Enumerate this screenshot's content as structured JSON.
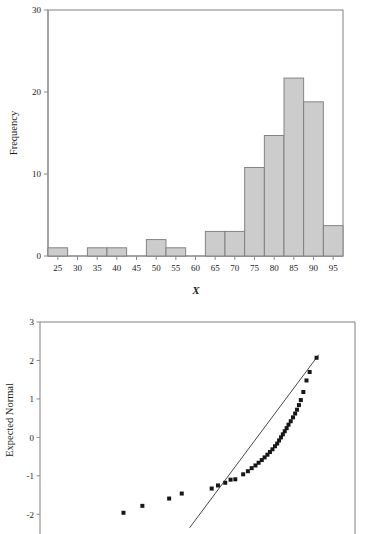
{
  "chart_data": [
    {
      "id": "histogram",
      "type": "bar",
      "title": "",
      "xlabel": "X",
      "ylabel": "Frequency",
      "xlim": [
        22.5,
        97.5
      ],
      "ylim": [
        0,
        30
      ],
      "grid": false,
      "legend": "none",
      "bin_width": 5,
      "xticks": [
        25,
        30,
        35,
        40,
        45,
        50,
        55,
        60,
        65,
        70,
        75,
        80,
        85,
        90,
        95
      ],
      "yticks": [
        0,
        10,
        20,
        30
      ],
      "bin_centers": [
        25,
        30,
        35,
        40,
        45,
        50,
        55,
        60,
        65,
        70,
        75,
        80,
        85,
        90,
        95
      ],
      "categories": [
        "25",
        "30",
        "35",
        "40",
        "45",
        "50",
        "55",
        "60",
        "65",
        "70",
        "75",
        "80",
        "85",
        "90",
        "95"
      ],
      "values": [
        1,
        0,
        1,
        1,
        0,
        2,
        1,
        0,
        3,
        3,
        10.8,
        14.7,
        21.7,
        18.8,
        3.7
      ],
      "bar_fill_color": "#cccccc",
      "bar_edge_color": "#7a7a7a"
    },
    {
      "id": "qq-plot",
      "type": "scatter",
      "title": "",
      "xlabel": "",
      "ylabel": "Expected Normal",
      "ylim": [
        -2.2,
        3
      ],
      "xlim": [
        0,
        100
      ],
      "grid": false,
      "legend": "none",
      "yticks": [
        3,
        2,
        1,
        0,
        -1,
        -2
      ],
      "marker": "square",
      "marker_color": "#171717",
      "reference_line": {
        "label": "normal reference line",
        "x_start": 47.5,
        "y_start": -2.35,
        "x_end": 88.5,
        "y_end": 2.15,
        "color": "#333333"
      },
      "points": [
        {
          "x": 26.5,
          "y": -1.96
        },
        {
          "x": 32.5,
          "y": -1.78
        },
        {
          "x": 41.0,
          "y": -1.59
        },
        {
          "x": 45.0,
          "y": -1.46
        },
        {
          "x": 54.5,
          "y": -1.33
        },
        {
          "x": 56.5,
          "y": -1.25
        },
        {
          "x": 58.8,
          "y": -1.18
        },
        {
          "x": 60.5,
          "y": -1.1
        },
        {
          "x": 62.0,
          "y": -1.09
        },
        {
          "x": 64.5,
          "y": -0.96
        },
        {
          "x": 66.0,
          "y": -0.88
        },
        {
          "x": 67.2,
          "y": -0.8
        },
        {
          "x": 68.4,
          "y": -0.73
        },
        {
          "x": 69.4,
          "y": -0.66
        },
        {
          "x": 70.4,
          "y": -0.59
        },
        {
          "x": 71.3,
          "y": -0.52
        },
        {
          "x": 72.2,
          "y": -0.45
        },
        {
          "x": 73.0,
          "y": -0.38
        },
        {
          "x": 73.8,
          "y": -0.31
        },
        {
          "x": 74.6,
          "y": -0.23
        },
        {
          "x": 75.3,
          "y": -0.16
        },
        {
          "x": 75.9,
          "y": -0.08
        },
        {
          "x": 76.5,
          "y": 0.0
        },
        {
          "x": 77.1,
          "y": 0.08
        },
        {
          "x": 77.7,
          "y": 0.16
        },
        {
          "x": 78.3,
          "y": 0.24
        },
        {
          "x": 78.9,
          "y": 0.33
        },
        {
          "x": 79.6,
          "y": 0.42
        },
        {
          "x": 80.3,
          "y": 0.52
        },
        {
          "x": 81.0,
          "y": 0.62
        },
        {
          "x": 81.6,
          "y": 0.72
        },
        {
          "x": 82.2,
          "y": 0.84
        },
        {
          "x": 82.8,
          "y": 0.97
        },
        {
          "x": 83.6,
          "y": 1.18
        },
        {
          "x": 84.6,
          "y": 1.48
        },
        {
          "x": 85.6,
          "y": 1.7
        },
        {
          "x": 87.8,
          "y": 2.07
        }
      ]
    }
  ],
  "histogram": {
    "ylabel": "Frequency",
    "xlabel": "X",
    "ytick_labels": [
      "0",
      "10",
      "20",
      "30"
    ],
    "xtick_labels": [
      "25",
      "30",
      "35",
      "40",
      "45",
      "50",
      "55",
      "60",
      "65",
      "70",
      "75",
      "80",
      "85",
      "90",
      "95"
    ]
  },
  "qqplot": {
    "ylabel": "Expected Normal",
    "ytick_labels": [
      "3",
      "2",
      "1",
      "0",
      "-1",
      "-2"
    ]
  }
}
